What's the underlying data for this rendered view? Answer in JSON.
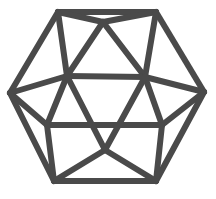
{
  "figure": {
    "stroke_color": "#4a4a4a",
    "stroke_width": 6,
    "background": "#ffffff",
    "vertices": {
      "A": [
        58,
        12
      ],
      "B": [
        156,
        12
      ],
      "T": [
        103,
        22
      ],
      "L": [
        10,
        93
      ],
      "R": [
        204,
        92
      ],
      "M1": [
        67,
        76
      ],
      "M2": [
        145,
        77
      ],
      "N1": [
        47,
        125
      ],
      "N2": [
        162,
        125
      ],
      "Bo": [
        105,
        150
      ],
      "C": [
        54,
        181
      ],
      "D": [
        156,
        181
      ]
    },
    "edges": [
      [
        "A",
        "B"
      ],
      [
        "A",
        "T"
      ],
      [
        "B",
        "T"
      ],
      [
        "A",
        "L"
      ],
      [
        "A",
        "M1"
      ],
      [
        "B",
        "R"
      ],
      [
        "B",
        "M2"
      ],
      [
        "T",
        "M1"
      ],
      [
        "T",
        "M2"
      ],
      [
        "M1",
        "M2"
      ],
      [
        "L",
        "M1"
      ],
      [
        "R",
        "M2"
      ],
      [
        "M1",
        "N1"
      ],
      [
        "M1",
        "Bo"
      ],
      [
        "M2",
        "N2"
      ],
      [
        "M2",
        "Bo"
      ],
      [
        "L",
        "N1"
      ],
      [
        "R",
        "N2"
      ],
      [
        "N1",
        "N2"
      ],
      [
        "L",
        "C"
      ],
      [
        "R",
        "D"
      ],
      [
        "N1",
        "C"
      ],
      [
        "N2",
        "D"
      ],
      [
        "Bo",
        "C"
      ],
      [
        "Bo",
        "D"
      ],
      [
        "C",
        "D"
      ]
    ]
  }
}
